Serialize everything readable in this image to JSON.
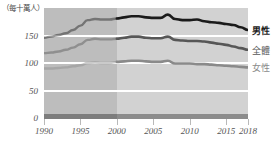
{
  "chart_data": {
    "type": "line",
    "title": "",
    "subtitle": "",
    "ylabel": "（每十萬人）",
    "xlabel": "",
    "xlim": [
      1990,
      2018
    ],
    "ylim": [
      0,
      200
    ],
    "yticks": [
      0,
      50,
      100,
      150
    ],
    "ytick_labels": [
      "0",
      "50",
      "100",
      "150"
    ],
    "xticks": [
      1990,
      1995,
      2000,
      2005,
      2010,
      2015,
      2018
    ],
    "xtick_labels": [
      "1990",
      "1995",
      "2000",
      "2005",
      "2010",
      "2015",
      "2018"
    ],
    "grid": true,
    "legend_position": "right",
    "annotation_shaded_region": {
      "from": 1990,
      "to": 2000,
      "note": "darker background shading before 2000"
    },
    "x": [
      1990,
      1991,
      1992,
      1993,
      1994,
      1995,
      1996,
      1997,
      1998,
      1999,
      2000,
      2001,
      2002,
      2003,
      2004,
      2005,
      2006,
      2007,
      2008,
      2009,
      2010,
      2011,
      2012,
      2013,
      2014,
      2015,
      2016,
      2017,
      2018
    ],
    "series": [
      {
        "name": "男性",
        "color": "#1a1a1a",
        "values": [
          146,
          148,
          151,
          154,
          160,
          168,
          178,
          180,
          179,
          179,
          181,
          183,
          185,
          185,
          183,
          182,
          182,
          188,
          180,
          178,
          178,
          179,
          176,
          174,
          173,
          171,
          169,
          165,
          160
        ]
      },
      {
        "name": "全體",
        "color": "#575757",
        "values": [
          118,
          119,
          121,
          124,
          128,
          134,
          142,
          144,
          143,
          143,
          144,
          146,
          148,
          148,
          146,
          145,
          145,
          148,
          142,
          141,
          140,
          140,
          139,
          137,
          135,
          133,
          130,
          127,
          124
        ]
      },
      {
        "name": "女性",
        "color": "#8a8a8a",
        "values": [
          90,
          90,
          91,
          92,
          94,
          96,
          100,
          101,
          100,
          100,
          102,
          103,
          104,
          104,
          103,
          102,
          102,
          104,
          99,
          99,
          99,
          98,
          98,
          97,
          96,
          95,
          94,
          93,
          92
        ]
      }
    ],
    "colors": {
      "plot_background": "#d2d2d2",
      "plot_background_early": "#bdbdbd",
      "gridline": "#ffffff",
      "baseline": "#8c8c8c",
      "axis_text": "#555555"
    }
  }
}
